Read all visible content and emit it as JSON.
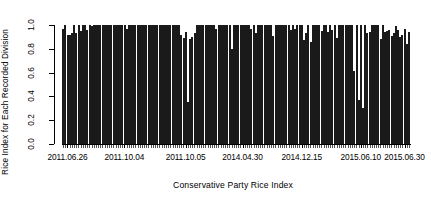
{
  "chart_data": {
    "type": "bar",
    "title": "",
    "xlabel": "Conservative Party Rice Index",
    "ylabel": "Rice Index for Each Recorded Division",
    "ylim": [
      0.0,
      1.0
    ],
    "ytick_labels": [
      "0.0",
      "0.2",
      "0.4",
      "0.6",
      "0.8",
      "1.0"
    ],
    "ytick_values": [
      0.0,
      0.2,
      0.4,
      0.6,
      0.8,
      1.0
    ],
    "grid": false,
    "legend": null,
    "xtick_labels": [
      "2011.06.26",
      "2011.10.04",
      "2011.10.05",
      "2014.04.30",
      "2014.12.15",
      "2015.06.10",
      "2015.06.30"
    ],
    "xtick_positions": [
      2,
      28,
      56,
      82,
      109,
      136,
      156
    ],
    "bar_color": "#b2b2b2",
    "bar_border_color": "#1a1a1a",
    "n_bars": 159,
    "values": [
      0.97,
      1.0,
      0.92,
      0.92,
      0.93,
      1.0,
      0.93,
      1.0,
      0.95,
      1.0,
      1.0,
      0.96,
      1.0,
      0.99,
      1.0,
      1.0,
      1.0,
      1.0,
      1.0,
      1.0,
      1.0,
      1.0,
      1.0,
      1.0,
      1.0,
      1.0,
      1.0,
      1.0,
      1.0,
      0.97,
      1.0,
      1.0,
      1.0,
      1.0,
      1.0,
      1.0,
      1.0,
      1.0,
      1.0,
      1.0,
      1.0,
      1.0,
      1.0,
      1.0,
      1.0,
      1.0,
      1.0,
      1.0,
      1.0,
      1.0,
      1.0,
      1.0,
      1.0,
      1.0,
      0.92,
      0.89,
      0.94,
      0.35,
      0.88,
      0.9,
      0.93,
      1.0,
      1.0,
      1.0,
      1.0,
      1.0,
      1.0,
      1.0,
      1.0,
      1.0,
      0.97,
      1.0,
      1.0,
      1.0,
      1.0,
      1.0,
      1.0,
      0.8,
      1.0,
      1.0,
      1.0,
      1.0,
      1.0,
      1.0,
      1.0,
      1.0,
      0.97,
      1.0,
      0.93,
      1.0,
      1.0,
      1.0,
      1.0,
      1.0,
      1.0,
      1.0,
      0.91,
      1.0,
      1.0,
      1.0,
      1.0,
      1.0,
      1.0,
      1.0,
      0.96,
      1.0,
      0.97,
      1.0,
      1.0,
      1.0,
      0.87,
      0.93,
      1.0,
      0.86,
      1.0,
      1.0,
      1.0,
      1.0,
      0.95,
      1.0,
      1.0,
      0.94,
      1.0,
      0.96,
      1.0,
      0.89,
      1.0,
      1.0,
      1.0,
      1.0,
      1.0,
      1.0,
      1.0,
      0.61,
      1.0,
      0.37,
      1.0,
      0.3,
      1.0,
      0.93,
      0.94,
      1.0,
      1.0,
      1.0,
      1.0,
      0.88,
      1.0,
      0.94,
      0.95,
      0.96,
      0.91,
      0.93,
      0.99,
      0.96,
      0.9,
      0.92,
      0.97,
      0.84,
      0.94
    ]
  }
}
